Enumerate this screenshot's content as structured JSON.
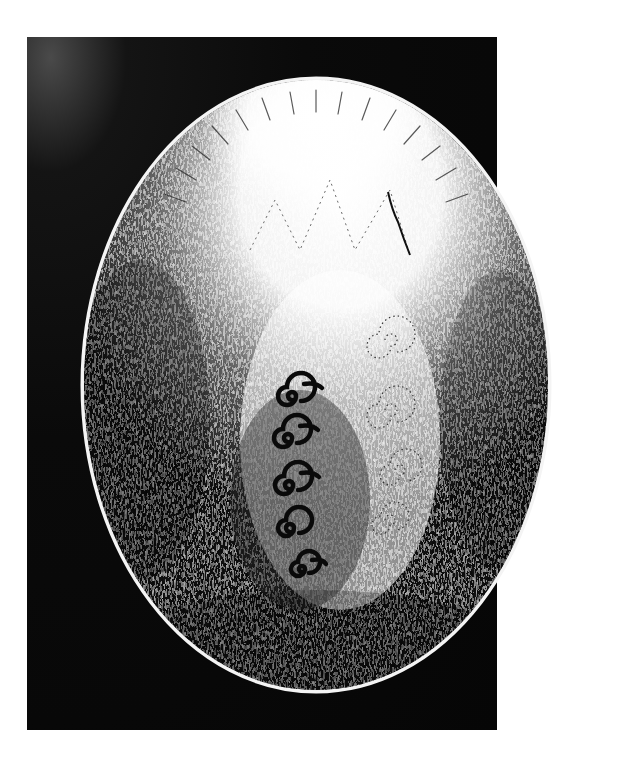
{
  "page": {
    "background": "#ffffff",
    "width": 632,
    "height": 766
  },
  "plate": {
    "color": "#0a0a0a",
    "x": 27,
    "y": 37,
    "width": 470,
    "height": 693
  },
  "oval": {
    "cx": 316,
    "cy": 385,
    "rx": 234,
    "ry": 307,
    "rim_color": "#f2f2f2",
    "description": "Engraved stippled oval with radiant sunburst glow at top, a large bulbous dotted form in the center, faint dotted spirals on the right, and a column of five bold black spirals on the left"
  },
  "spirals": {
    "color": "#0a0a0a",
    "items": [
      {
        "cx": 290,
        "cy": 398,
        "r": 14
      },
      {
        "cx": 286,
        "cy": 440,
        "r": 14
      },
      {
        "cx": 287,
        "cy": 487,
        "r": 14
      },
      {
        "cx": 288,
        "cy": 530,
        "r": 13
      },
      {
        "cx": 300,
        "cy": 570,
        "r": 11
      }
    ]
  },
  "faint_spirals": {
    "items": [
      {
        "cx": 385,
        "cy": 340,
        "r": 18
      },
      {
        "cx": 385,
        "cy": 410,
        "r": 18
      },
      {
        "cx": 395,
        "cy": 470,
        "r": 16
      },
      {
        "cx": 385,
        "cy": 520,
        "r": 14
      }
    ]
  },
  "labels": {
    "top_cutoff": ""
  }
}
